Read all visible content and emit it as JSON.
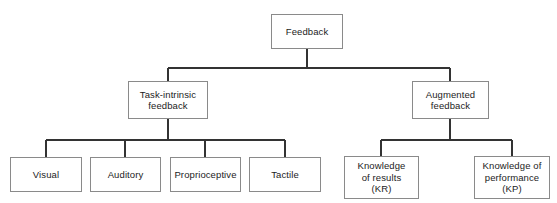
{
  "diagram": {
    "type": "hierarchy-tree",
    "levels": 3,
    "colors": {
      "box_border": "#8a8a8a",
      "connector": "#333333",
      "text": "#1c1c1c",
      "background": "#ffffff"
    },
    "nodes": {
      "root": {
        "label": "Feedback",
        "x": 271,
        "y": 14,
        "w": 72,
        "h": 35
      },
      "branch_left": {
        "label": "Task-intrinsic\nfeedback",
        "x": 128,
        "y": 81,
        "w": 80,
        "h": 38
      },
      "branch_right": {
        "label": "Augmented\nfeedback",
        "x": 412,
        "y": 81,
        "w": 77,
        "h": 38
      },
      "leaf_visual": {
        "label": "Visual",
        "x": 10,
        "y": 157,
        "w": 72,
        "h": 35
      },
      "leaf_auditory": {
        "label": "Auditory",
        "x": 90,
        "y": 157,
        "w": 71,
        "h": 35
      },
      "leaf_proprioceptive": {
        "label": "Proprioceptive",
        "x": 170,
        "y": 157,
        "w": 71,
        "h": 35
      },
      "leaf_tactile": {
        "label": "Tactile",
        "x": 249,
        "y": 157,
        "w": 72,
        "h": 35
      },
      "leaf_kr": {
        "label": "Knowledge\nof results\n(KR)",
        "x": 344,
        "y": 156,
        "w": 75,
        "h": 43
      },
      "leaf_kp": {
        "label": "Knowledge of\nperformance\n(KP)",
        "x": 474,
        "y": 156,
        "w": 76,
        "h": 43
      }
    },
    "edges": [
      {
        "from": "root",
        "to": "branch_left"
      },
      {
        "from": "root",
        "to": "branch_right"
      },
      {
        "from": "branch_left",
        "to": "leaf_visual"
      },
      {
        "from": "branch_left",
        "to": "leaf_auditory"
      },
      {
        "from": "branch_left",
        "to": "leaf_proprioceptive"
      },
      {
        "from": "branch_left",
        "to": "leaf_tactile"
      },
      {
        "from": "branch_right",
        "to": "leaf_kr"
      },
      {
        "from": "branch_right",
        "to": "leaf_kp"
      }
    ]
  }
}
